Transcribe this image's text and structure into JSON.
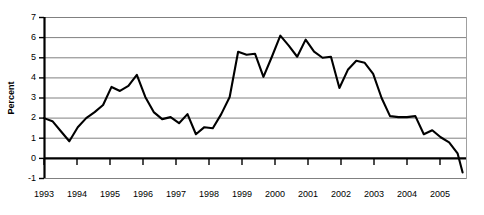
{
  "chart_data": {
    "type": "line",
    "title": "",
    "xlabel": "",
    "ylabel": "Percent",
    "ylim": [
      -1,
      7
    ],
    "xlim": [
      1993.0,
      2005.5
    ],
    "grid": true,
    "legend": null,
    "y_ticks": [
      7,
      6,
      5,
      4,
      3,
      2,
      1,
      0,
      -1
    ],
    "y_tick_labels": [
      "7",
      "6",
      "5",
      "4",
      "3",
      "2",
      "1",
      "0",
      "-1"
    ],
    "x_ticks": [
      1993,
      1994,
      1995,
      1996,
      1997,
      1998,
      1999,
      2000,
      2001,
      2002,
      2003,
      2004,
      2005
    ],
    "x_tick_labels": [
      "1993",
      "1994",
      "1995",
      "1996",
      "1997",
      "1998",
      "1999",
      "2000",
      "2001",
      "2002",
      "2003",
      "2004",
      "2005"
    ],
    "series": [
      {
        "name": "Percent",
        "x": [
          1993.0,
          1993.25,
          1993.5,
          1993.75,
          1994.0,
          1994.25,
          1994.5,
          1994.75,
          1995.0,
          1995.25,
          1995.5,
          1995.75,
          1996.0,
          1996.25,
          1996.5,
          1996.75,
          1997.0,
          1997.25,
          1997.5,
          1997.75,
          1998.0,
          1998.25,
          1998.5,
          1998.75,
          1999.0,
          1999.25,
          1999.5,
          1999.75,
          2000.0,
          2000.25,
          2000.5,
          2000.75,
          2001.0,
          2001.25,
          2001.5,
          2001.75,
          2002.0,
          2002.25,
          2002.5,
          2002.75,
          2003.0,
          2003.25,
          2003.5,
          2003.75,
          2004.0,
          2004.25,
          2004.5,
          2004.75,
          2005.0,
          2005.25,
          2005.4
        ],
        "values": [
          2.0,
          1.85,
          1.35,
          0.85,
          1.55,
          2.0,
          2.3,
          2.65,
          3.55,
          3.35,
          3.6,
          4.15,
          3.05,
          2.3,
          1.95,
          2.05,
          1.75,
          2.2,
          1.2,
          1.55,
          1.5,
          2.2,
          3.05,
          5.3,
          5.15,
          5.2,
          4.05,
          5.05,
          6.1,
          5.6,
          5.05,
          5.9,
          5.3,
          5.0,
          5.05,
          3.5,
          4.4,
          4.85,
          4.75,
          4.2,
          3.0,
          2.1,
          2.05,
          2.05,
          2.1,
          1.2,
          1.4,
          1.05,
          0.8,
          0.25,
          -0.7
        ]
      }
    ]
  },
  "axes": {
    "y_title": "Percent"
  }
}
